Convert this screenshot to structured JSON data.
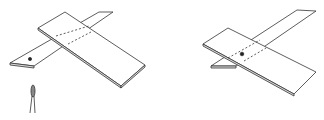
{
  "figure": {
    "panels": [
      {
        "id": "left",
        "description": "two crossed boards with a hole in the lower strip and a tool below"
      },
      {
        "id": "right",
        "description": "two crossed boards pinned at the center"
      }
    ],
    "colors": {
      "stroke": "#333333",
      "background": "#ffffff"
    }
  }
}
